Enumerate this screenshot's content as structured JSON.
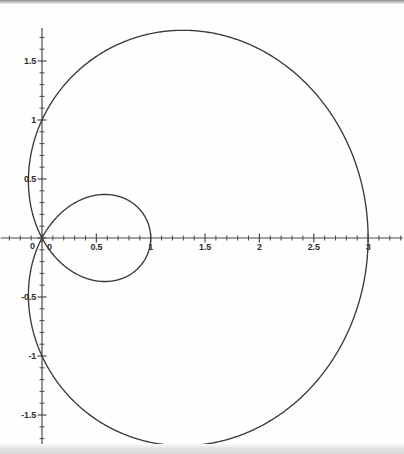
{
  "figure": {
    "title": "",
    "background_color": "#fefefe",
    "curve_color": "#3a3a3a",
    "axis_color": "#4a4a4a",
    "width": 404,
    "height": 454
  },
  "axes": {
    "x_axis_name": "x-axis",
    "y_axis_name": "y-axis",
    "x_ticks": [
      "0",
      "0.5",
      "1",
      "1.5",
      "2",
      "2.5",
      "3"
    ],
    "x_tick_values": [
      0,
      0.5,
      1,
      1.5,
      2,
      2.5,
      3
    ],
    "y_ticks": [
      "1.5",
      "1",
      "0.5",
      "0",
      "-0.5",
      "-1",
      "-1.5"
    ],
    "y_tick_values": [
      1.5,
      1,
      0.5,
      0,
      -0.5,
      -1,
      -1.5
    ],
    "origin_label_x": "0",
    "origin_label_y": "0",
    "minor_ticks_per_major": 5,
    "xlim": [
      -0.38,
      3.32
    ],
    "ylim": [
      -1.78,
      1.78
    ],
    "grid": false,
    "xlabel": "",
    "ylabel": ""
  },
  "chart_data": {
    "type": "line",
    "title": "",
    "xlabel": "",
    "ylabel": "",
    "xlim": [
      -0.38,
      3.32
    ],
    "ylim": [
      -1.78,
      1.78
    ],
    "grid": false,
    "legend": [],
    "curve_name": "limacon r = 1 + 2 cos(theta)",
    "polar_equation": "r = 1 + 2*cos(theta)",
    "series": [
      {
        "name": "outer loop",
        "description": "Outer loop of the limacon, passes through (3,0), (0,1), (0,-1); leftmost extent near x = -0.13",
        "key_points": [
          {
            "x": 3.0,
            "y": 0.0
          },
          {
            "x": 1.3,
            "y": 1.76
          },
          {
            "x": 0.0,
            "y": 1.0
          },
          {
            "x": -0.13,
            "y": 0.6
          },
          {
            "x": -0.13,
            "y": -0.6
          },
          {
            "x": 0.0,
            "y": -1.0
          },
          {
            "x": 1.3,
            "y": -1.76
          }
        ]
      },
      {
        "name": "inner loop",
        "description": "Inner loop of the limacon from the origin out to (1,0)",
        "key_points": [
          {
            "x": 0.0,
            "y": 0.0
          },
          {
            "x": 0.55,
            "y": 0.38
          },
          {
            "x": 1.0,
            "y": 0.0
          },
          {
            "x": 0.55,
            "y": -0.38
          }
        ]
      }
    ]
  }
}
